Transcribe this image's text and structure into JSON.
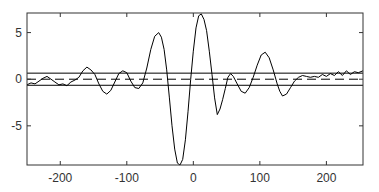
{
  "chart_data": {
    "type": "line",
    "title": "",
    "xlabel": "",
    "ylabel": "",
    "xlim": [
      -250,
      255
    ],
    "ylim": [
      -9.2,
      7.1
    ],
    "grid": false,
    "legend": null,
    "xticks": [
      -200,
      -100,
      0,
      100,
      200
    ],
    "xtick_labels": [
      "-200",
      "-100",
      "0",
      "100",
      "200"
    ],
    "yticks": [
      5,
      0,
      -5
    ],
    "ytick_labels": [
      "5",
      "0",
      "-5"
    ],
    "series": [
      {
        "name": "signal",
        "style": "solid",
        "color": "#000000",
        "x": [
          -250,
          -244,
          -238,
          -232,
          -226,
          -220,
          -214,
          -208,
          -202,
          -196,
          -190,
          -184,
          -178,
          -172,
          -166,
          -160,
          -154,
          -148,
          -142,
          -136,
          -130,
          -124,
          -118,
          -112,
          -106,
          -100,
          -94,
          -88,
          -82,
          -76,
          -70,
          -64,
          -58,
          -52,
          -48,
          -44,
          -40,
          -36,
          -32,
          -28,
          -24,
          -20,
          -16,
          -12,
          -8,
          -4,
          0,
          4,
          8,
          12,
          16,
          20,
          24,
          28,
          32,
          36,
          40,
          44,
          48,
          52,
          56,
          60,
          66,
          72,
          78,
          84,
          90,
          96,
          102,
          108,
          114,
          120,
          126,
          130,
          134,
          140,
          146,
          152,
          158,
          164,
          170,
          176,
          182,
          188,
          194,
          200,
          206,
          212,
          218,
          224,
          230,
          236,
          242,
          248,
          255
        ],
        "y": [
          -0.6,
          -0.4,
          -0.5,
          -0.2,
          0.1,
          0.3,
          0.0,
          -0.3,
          -0.6,
          -0.5,
          -0.7,
          -0.3,
          -0.1,
          0.2,
          0.9,
          1.3,
          1.0,
          0.5,
          -0.5,
          -1.3,
          -1.6,
          -1.2,
          -0.3,
          0.6,
          0.9,
          0.7,
          -0.2,
          -0.9,
          -1.0,
          -0.4,
          1.2,
          3.2,
          4.6,
          5.0,
          4.5,
          3.2,
          1.0,
          -2.0,
          -5.0,
          -7.5,
          -9.0,
          -9.2,
          -8.6,
          -6.5,
          -3.5,
          0.0,
          3.0,
          5.5,
          6.8,
          7.0,
          6.4,
          5.2,
          3.0,
          0.5,
          -2.0,
          -3.8,
          -3.2,
          -2.2,
          -1.0,
          0.2,
          0.6,
          0.3,
          -0.5,
          -1.3,
          -1.5,
          -0.9,
          0.2,
          1.5,
          2.6,
          2.9,
          2.3,
          1.0,
          -0.5,
          -1.3,
          -1.8,
          -1.6,
          -0.9,
          -0.2,
          0.2,
          0.4,
          0.3,
          0.2,
          0.3,
          0.2,
          0.5,
          0.3,
          0.6,
          0.4,
          0.8,
          0.4,
          0.9,
          0.5,
          0.8,
          0.7,
          0.9
        ]
      },
      {
        "name": "upper-threshold",
        "style": "solid",
        "color": "#000000",
        "y_const": 0.65
      },
      {
        "name": "zero-line",
        "style": "dashed",
        "color": "#000000",
        "y_const": 0
      },
      {
        "name": "lower-threshold",
        "style": "solid",
        "color": "#000000",
        "y_const": -0.65
      }
    ]
  }
}
